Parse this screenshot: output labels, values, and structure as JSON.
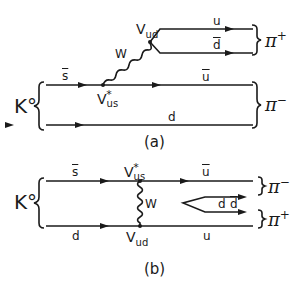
{
  "diagram_a": {
    "caption": "(a)",
    "initial_state": "K°",
    "quark_top": "s",
    "quark_top_bar": true,
    "quark_bottom": "d",
    "boson": "W",
    "vertex_lower": "V",
    "vertex_lower_sub": "us",
    "vertex_lower_sup": "*",
    "vertex_upper": "V",
    "vertex_upper_sub": "ud",
    "out_u": "u",
    "out_dbar": "d",
    "out_ubar": "u",
    "pion_upper": "π",
    "pion_upper_charge": "+",
    "pion_lower": "π",
    "pion_lower_charge": "−"
  },
  "diagram_b": {
    "caption": "(b)",
    "initial_state": "K°",
    "quark_top": "s",
    "quark_bottom": "d",
    "boson": "W",
    "vertex_top": "V",
    "vertex_top_sub": "us",
    "vertex_top_sup": "*",
    "vertex_bottom": "V",
    "vertex_bottom_sub": "ud",
    "out_ubar": "u",
    "out_d": "d",
    "out_dbar": "d",
    "out_u": "u",
    "pion_upper": "π",
    "pion_upper_charge": "−",
    "pion_lower": "π",
    "pion_lower_charge": "+"
  }
}
